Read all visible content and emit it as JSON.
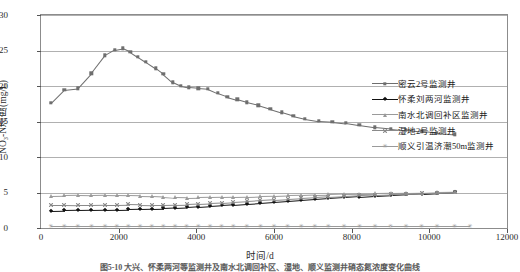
{
  "chart_data": {
    "type": "line",
    "title": "",
    "xlabel": "时间/d",
    "ylabel": "NO₃-N浓度(mg/L)",
    "xlim": [
      0,
      12000
    ],
    "ylim": [
      0,
      30
    ],
    "xticks": [
      0,
      2000,
      4000,
      6000,
      8000,
      10000,
      12000
    ],
    "yticks": [
      0,
      5,
      10,
      15,
      20,
      25,
      30
    ],
    "grid": "horizontal",
    "legend_position": "right",
    "series": [
      {
        "name": "密云2号监测井",
        "marker": "square",
        "color": "#6e6e6e",
        "x": [
          250,
          600,
          950,
          1300,
          1650,
          1900,
          2100,
          2300,
          2500,
          2700,
          2950,
          3150,
          3400,
          3600,
          3800,
          4050,
          4300,
          4550,
          4800,
          5050,
          5300,
          5600,
          5900,
          6200,
          6500,
          6800,
          7150,
          7500,
          7850,
          8200,
          8600,
          9000,
          9400,
          9800,
          10200,
          10650
        ],
        "y": [
          17.6,
          19.5,
          19.7,
          21.8,
          24.3,
          25.1,
          25.3,
          24.8,
          24.1,
          23.4,
          22.5,
          21.7,
          20.5,
          20.0,
          19.8,
          19.7,
          19.6,
          19.0,
          18.5,
          18.1,
          17.7,
          17.3,
          16.8,
          16.3,
          15.8,
          15.4,
          15.1,
          15.0,
          14.8,
          14.5,
          14.2,
          14.0,
          13.8,
          13.6,
          13.4,
          13.2
        ]
      },
      {
        "name": "怀柔刘两河监测井",
        "marker": "diamond",
        "color": "#121212",
        "x": [
          250,
          600,
          950,
          1300,
          1650,
          1950,
          2250,
          2550,
          2850,
          3150,
          3450,
          3750,
          4050,
          4350,
          4650,
          4950,
          5300,
          5650,
          6000,
          6350,
          6700,
          7050,
          7400,
          7800,
          8200,
          8600,
          9000,
          9400,
          9800,
          10200,
          10650
        ],
        "y": [
          2.45,
          2.48,
          2.5,
          2.52,
          2.55,
          2.58,
          2.62,
          2.66,
          2.7,
          2.75,
          2.82,
          2.9,
          3.0,
          3.1,
          3.2,
          3.3,
          3.42,
          3.55,
          3.68,
          3.8,
          3.92,
          4.05,
          4.18,
          4.3,
          4.42,
          4.55,
          4.65,
          4.75,
          4.85,
          4.95,
          5.05
        ]
      },
      {
        "name": "南水北调回补区监测井",
        "marker": "triangle",
        "color": "#9a9a9a",
        "x": [
          250,
          600,
          950,
          1300,
          1650,
          1950,
          2250,
          2550,
          2850,
          3150,
          3450,
          3750,
          4050,
          4350,
          4650,
          4950,
          5300,
          5650,
          6000,
          6350,
          6700,
          7050,
          7400,
          7800,
          8200,
          8600,
          9000,
          9400,
          9800,
          10200,
          10650
        ],
        "y": [
          4.55,
          4.6,
          4.62,
          4.6,
          4.62,
          4.6,
          4.58,
          4.55,
          4.5,
          4.42,
          4.3,
          4.28,
          4.3,
          4.32,
          4.35,
          4.4,
          4.42,
          4.48,
          4.52,
          4.58,
          4.62,
          4.68,
          4.72,
          4.78,
          4.82,
          4.86,
          4.9,
          4.95,
          5.0,
          5.05,
          5.1
        ]
      },
      {
        "name": "湿地2号监测井",
        "marker": "x",
        "color": "#8a8a8a",
        "x": [
          250,
          600,
          950,
          1300,
          1650,
          1950,
          2250,
          2550,
          2850,
          3150,
          3450,
          3750,
          4050,
          4350,
          4650,
          4950,
          5300,
          5650,
          6000,
          6350,
          6700,
          7050,
          7400,
          7800,
          8200,
          8600,
          9000,
          9400,
          9800,
          10200,
          10650
        ],
        "y": [
          3.3,
          3.3,
          3.28,
          3.28,
          3.3,
          3.3,
          3.32,
          3.3,
          3.28,
          3.28,
          3.3,
          3.35,
          3.42,
          3.5,
          3.58,
          3.68,
          3.78,
          3.9,
          4.0,
          4.1,
          4.2,
          4.3,
          4.4,
          4.5,
          4.6,
          4.68,
          4.76,
          4.84,
          4.92,
          5.0,
          5.08
        ]
      },
      {
        "name": "顺义引温济潮50m监测井",
        "marker": "star",
        "color": "#9a9a9a",
        "x": [
          250,
          600,
          950,
          1300,
          1650,
          1950,
          2250,
          2550,
          2850,
          3150,
          3450,
          3750,
          4050,
          4350,
          4650,
          4950,
          5300,
          5650,
          6000,
          6350,
          6700,
          7050,
          7400,
          7800,
          8200,
          8600,
          9000,
          9400,
          9800,
          10200,
          10650,
          11050
        ],
        "y": [
          0.22,
          0.22,
          0.22,
          0.22,
          0.22,
          0.22,
          0.22,
          0.22,
          0.22,
          0.22,
          0.22,
          0.22,
          0.22,
          0.22,
          0.22,
          0.22,
          0.22,
          0.22,
          0.22,
          0.22,
          0.22,
          0.22,
          0.22,
          0.22,
          0.22,
          0.22,
          0.22,
          0.22,
          0.22,
          0.22,
          0.22,
          0.22
        ]
      }
    ]
  },
  "caption": "图5-10   大兴、怀柔两河等监测井及南水北调回补区、湿地、顺义监测井硝态氮浓度变化曲线"
}
